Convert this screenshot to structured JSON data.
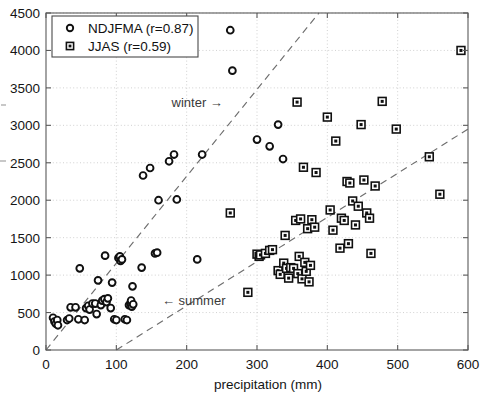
{
  "chart_data": {
    "type": "scatter",
    "title": "",
    "xlabel": "precipitation (mm)",
    "ylabel": "",
    "xlim": [
      0,
      600
    ],
    "ylim": [
      0,
      4500
    ],
    "xticks": [
      0,
      100,
      200,
      300,
      400,
      500,
      600
    ],
    "yticks": [
      0,
      500,
      1000,
      1500,
      2000,
      2500,
      3000,
      3500,
      4000,
      4500
    ],
    "grid": true,
    "legend_position": "upper-left",
    "series": [
      {
        "name": "NDJFMA (r=0.87)",
        "label": "NDJFMA",
        "correlation": 0.87,
        "marker": "circle",
        "points": [
          [
            10,
            430
          ],
          [
            12,
            380
          ],
          [
            14,
            350
          ],
          [
            16,
            400
          ],
          [
            17,
            330
          ],
          [
            30,
            400
          ],
          [
            33,
            420
          ],
          [
            35,
            570
          ],
          [
            42,
            570
          ],
          [
            46,
            410
          ],
          [
            48,
            1090
          ],
          [
            55,
            400
          ],
          [
            57,
            560
          ],
          [
            60,
            590
          ],
          [
            62,
            540
          ],
          [
            66,
            620
          ],
          [
            70,
            620
          ],
          [
            72,
            480
          ],
          [
            74,
            930
          ],
          [
            78,
            600
          ],
          [
            80,
            660
          ],
          [
            83,
            680
          ],
          [
            84,
            1260
          ],
          [
            86,
            640
          ],
          [
            88,
            690
          ],
          [
            92,
            560
          ],
          [
            94,
            900
          ],
          [
            97,
            410
          ],
          [
            100,
            400
          ],
          [
            103,
            1230
          ],
          [
            105,
            1250
          ],
          [
            106,
            1190
          ],
          [
            108,
            1210
          ],
          [
            112,
            410
          ],
          [
            115,
            400
          ],
          [
            118,
            600
          ],
          [
            120,
            620
          ],
          [
            121,
            660
          ],
          [
            122,
            580
          ],
          [
            123,
            850
          ],
          [
            124,
            610
          ],
          [
            136,
            1100
          ],
          [
            138,
            2330
          ],
          [
            148,
            2430
          ],
          [
            155,
            1290
          ],
          [
            158,
            1300
          ],
          [
            160,
            2000
          ],
          [
            175,
            2520
          ],
          [
            182,
            2610
          ],
          [
            186,
            2010
          ],
          [
            215,
            1210
          ],
          [
            222,
            2610
          ],
          [
            262,
            4270
          ],
          [
            265,
            3730
          ],
          [
            300,
            2810
          ],
          [
            318,
            2720
          ],
          [
            330,
            3010
          ],
          [
            337,
            2550
          ]
        ]
      },
      {
        "name": "JJAS (r=0.59)",
        "label": "JJAS",
        "correlation": 0.59,
        "marker": "square",
        "points": [
          [
            262,
            1830
          ],
          [
            287,
            770
          ],
          [
            300,
            1280
          ],
          [
            303,
            1250
          ],
          [
            305,
            1270
          ],
          [
            312,
            1290
          ],
          [
            318,
            1330
          ],
          [
            322,
            1340
          ],
          [
            330,
            1060
          ],
          [
            333,
            1010
          ],
          [
            338,
            1160
          ],
          [
            340,
            1530
          ],
          [
            342,
            1090
          ],
          [
            345,
            960
          ],
          [
            348,
            1100
          ],
          [
            352,
            1090
          ],
          [
            355,
            1730
          ],
          [
            357,
            3310
          ],
          [
            358,
            1020
          ],
          [
            360,
            1250
          ],
          [
            362,
            1750
          ],
          [
            364,
            950
          ],
          [
            366,
            2440
          ],
          [
            368,
            1170
          ],
          [
            370,
            1050
          ],
          [
            372,
            1620
          ],
          [
            374,
            910
          ],
          [
            376,
            1130
          ],
          [
            378,
            1740
          ],
          [
            382,
            1640
          ],
          [
            384,
            2370
          ],
          [
            400,
            3110
          ],
          [
            404,
            1870
          ],
          [
            408,
            1600
          ],
          [
            412,
            2790
          ],
          [
            418,
            1360
          ],
          [
            420,
            1760
          ],
          [
            424,
            1730
          ],
          [
            428,
            2250
          ],
          [
            430,
            1420
          ],
          [
            432,
            2230
          ],
          [
            436,
            1990
          ],
          [
            440,
            1670
          ],
          [
            444,
            1920
          ],
          [
            448,
            3010
          ],
          [
            452,
            2270
          ],
          [
            456,
            1830
          ],
          [
            460,
            1760
          ],
          [
            462,
            1290
          ],
          [
            468,
            2190
          ],
          [
            478,
            3320
          ],
          [
            498,
            2950
          ],
          [
            545,
            2580
          ],
          [
            560,
            2080
          ],
          [
            590,
            4000
          ]
        ]
      }
    ],
    "reference_lines": [
      {
        "name": "winter-line",
        "style": "dashed",
        "points": [
          [
            0,
            0
          ],
          [
            388,
            4500
          ]
        ]
      },
      {
        "name": "summer-line",
        "style": "dashed",
        "points": [
          [
            100,
            0
          ],
          [
            600,
            2950
          ]
        ]
      }
    ],
    "annotations": [
      {
        "name": "winter-annotation",
        "text": "winter →",
        "x": 215,
        "y": 3240
      },
      {
        "name": "summer-annotation",
        "text": "← summer",
        "x": 210,
        "y": 600
      }
    ]
  },
  "legend": {
    "entries": [
      {
        "marker": "circle",
        "label": "NDJFMA (r=0.87)"
      },
      {
        "marker": "square",
        "label": "JJAS (r=0.59)"
      }
    ]
  },
  "colors": {
    "marker_stroke": "#101010",
    "axis": "#5a5a5a",
    "grid": "#bdbdbd",
    "reference_line": "#6e6e6e",
    "background": "#ffffff"
  }
}
